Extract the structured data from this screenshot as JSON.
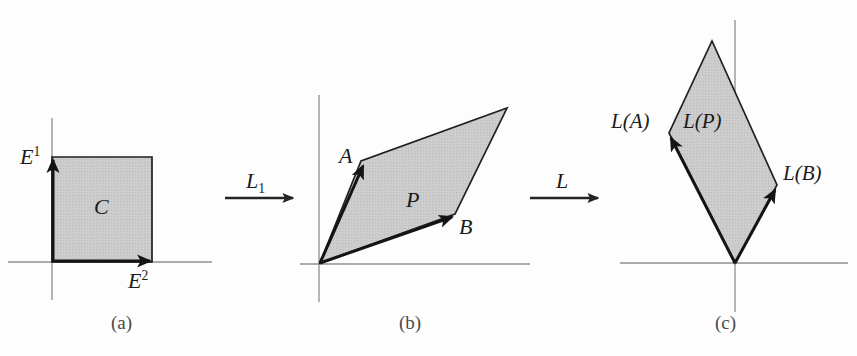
{
  "figure": {
    "width": 857,
    "height": 356,
    "background_color": "#fdfdfd",
    "shape_fill_color": "#c9c9c9",
    "shape_stroke_color": "#1b1b1b",
    "axis_color": "#8a8a8a",
    "label_color": "#1b1b1b",
    "caption_color": "#4a4a4a"
  },
  "panels": [
    {
      "id": "a",
      "caption": "(a)",
      "shape_name": "C",
      "shape_label": "C",
      "shape_type": "square",
      "basis_vectors": [
        {
          "name": "E1",
          "label": "E",
          "superscript": "1",
          "direction": "up"
        },
        {
          "name": "E2",
          "label": "E",
          "superscript": "2",
          "direction": "right"
        }
      ],
      "origin": {
        "x": 52,
        "y": 262
      },
      "vertices": [
        {
          "x": 52,
          "y": 262
        },
        {
          "x": 152,
          "y": 262
        },
        {
          "x": 152,
          "y": 157
        },
        {
          "x": 52,
          "y": 157
        }
      ]
    },
    {
      "id": "b",
      "caption": "(b)",
      "shape_name": "P",
      "shape_label": "P",
      "shape_type": "parallelogram",
      "basis_vectors": [
        {
          "name": "A",
          "label": "A",
          "superscript": "",
          "direction": "up-right"
        },
        {
          "name": "B",
          "label": "B",
          "superscript": "",
          "direction": "right-up"
        }
      ],
      "origin": {
        "x": 320,
        "y": 263
      },
      "vertices": [
        {
          "x": 320,
          "y": 263
        },
        {
          "x": 455,
          "y": 214
        },
        {
          "x": 507,
          "y": 108
        },
        {
          "x": 361,
          "y": 161
        }
      ]
    },
    {
      "id": "c",
      "caption": "(c)",
      "shape_name": "L(P)",
      "shape_label": "L(P)",
      "shape_type": "parallelogram",
      "basis_vectors": [
        {
          "name": "L(A)",
          "label": "L(A)",
          "superscript": "",
          "direction": "up-left"
        },
        {
          "name": "L(B)",
          "label": "L(B)",
          "superscript": "",
          "direction": "up-right"
        }
      ],
      "origin": {
        "x": 735,
        "y": 263
      },
      "vertices": [
        {
          "x": 735,
          "y": 263
        },
        {
          "x": 777,
          "y": 185
        },
        {
          "x": 712,
          "y": 41
        },
        {
          "x": 669,
          "y": 133
        }
      ]
    }
  ],
  "transform_arrows": [
    {
      "name": "L1",
      "label": "L",
      "subscript": "1",
      "from_panel": "a",
      "to_panel": "b",
      "x1": 225,
      "y1": 198,
      "x2": 295,
      "y2": 198
    },
    {
      "name": "L",
      "label": "L",
      "subscript": "",
      "from_panel": "b",
      "to_panel": "c",
      "x1": 530,
      "y1": 198,
      "x2": 600,
      "y2": 198
    }
  ],
  "labels": {
    "panel_a_E1": "E",
    "panel_a_E1_sup": "1",
    "panel_a_E2": "E",
    "panel_a_E2_sup": "2",
    "panel_a_shape": "C",
    "panel_a_caption": "(a)",
    "arrow_L1": "L",
    "arrow_L1_sub": "1",
    "panel_b_A": "A",
    "panel_b_B": "B",
    "panel_b_shape": "P",
    "panel_b_caption": "(b)",
    "arrow_L": "L",
    "panel_c_LA": "L(A)",
    "panel_c_LB": "L(B)",
    "panel_c_shape": "L(P)",
    "panel_c_caption": "(c)"
  }
}
